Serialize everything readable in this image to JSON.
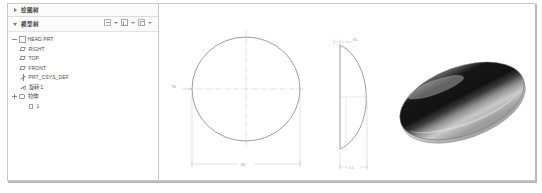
{
  "window": {
    "title": "CAD Model Tree and Drawing Views"
  },
  "sidebar": {
    "panels": [
      {
        "name": "panel-drawing-tree",
        "label": "绘图树",
        "expanded": false,
        "twisty": "chevron-right-icon"
      },
      {
        "name": "panel-model-tree",
        "label": "模型树",
        "expanded": true,
        "twisty": "chevron-down-icon"
      }
    ],
    "toolbar": {
      "items": [
        {
          "name": "filter-settings-icon",
          "label": "",
          "caret": true
        },
        {
          "name": "tree-columns-icon",
          "label": "",
          "caret": true
        },
        {
          "name": "display-settings-icon",
          "label": "",
          "caret": true
        }
      ]
    },
    "tree": [
      {
        "label": "HEAD.PRT",
        "icon": "part-icon",
        "indent": 0,
        "expander": "minus"
      },
      {
        "label": "RIGHT",
        "icon": "plane-icon",
        "indent": 1,
        "expander": "none"
      },
      {
        "label": "TOP",
        "icon": "plane-icon",
        "indent": 1,
        "expander": "none"
      },
      {
        "label": "FRONT",
        "icon": "plane-icon",
        "indent": 1,
        "expander": "none"
      },
      {
        "label": "PRT_CSYS_DEF",
        "icon": "csys-icon",
        "indent": 1,
        "expander": "none"
      },
      {
        "label": "旋转 1",
        "icon": "axis-icon",
        "indent": 1,
        "expander": "none"
      },
      {
        "label": "拉伸",
        "icon": "feature-icon",
        "indent": 1,
        "expander": "plus"
      },
      {
        "label": "1",
        "icon": "sheet-icon",
        "indent": 2,
        "expander": "none"
      }
    ]
  },
  "canvas": {
    "views": [
      {
        "name": "front-circle-view",
        "type": "circle",
        "dim_vertical": "R1",
        "dim_horizontal": "Ø2"
      },
      {
        "name": "side-profile-view",
        "type": "d-profile",
        "dim_top": "R1",
        "dim_bottom": "1.5"
      },
      {
        "name": "shaded-3d-view",
        "type": "shaded-dome"
      }
    ]
  },
  "colors": {
    "frame_border": "#c8c8c8",
    "panel_header_bg": "#fbfbfb",
    "geometry_line": "#8a8a8a",
    "center_line": "#b5b5b5",
    "dim_text": "#8e8e8e",
    "shade_dark": "#1a1a1a",
    "shade_light": "#d8d8d8"
  }
}
